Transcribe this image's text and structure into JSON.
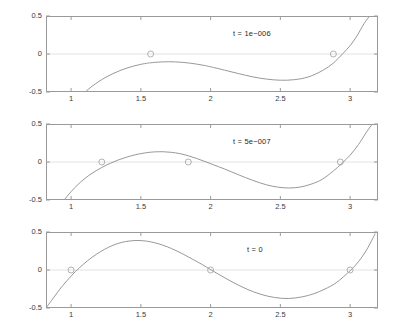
{
  "figure": {
    "background": "#ffffff",
    "axis_color": "#9a9a9a",
    "curve_color": "#8c8c8c",
    "marker_color": "#a8a8a8",
    "zeroline_color": "#e2e2e2",
    "text_color": "#3a3a3a"
  },
  "chart_data": [
    {
      "type": "line",
      "title": "t = 1e−006",
      "xlabel": "",
      "ylabel": "",
      "xlim": [
        0.82,
        3.2
      ],
      "ylim": [
        -0.5,
        0.5
      ],
      "xticks": [
        1,
        1.5,
        2,
        2.5,
        3
      ],
      "xticklabels": [
        "1",
        "1.5",
        "2",
        "2.5",
        "3"
      ],
      "yticks": [
        -0.5,
        0,
        0.5
      ],
      "yticklabels": [
        "-0.5",
        "0",
        "0.5"
      ],
      "grid": false,
      "legend": "none",
      "series": [
        {
          "name": "curve",
          "x": [
            1.1,
            1.15,
            1.2,
            1.25,
            1.3,
            1.35,
            1.4,
            1.45,
            1.5,
            1.55,
            1.57,
            1.6,
            1.65,
            1.7,
            1.75,
            1.8,
            1.85,
            1.9,
            1.95,
            2.0,
            2.1,
            2.2,
            2.3,
            2.4,
            2.5,
            2.6,
            2.7,
            2.8,
            2.88,
            2.95,
            3.0,
            3.05,
            3.1,
            3.14
          ],
          "y": [
            -0.5,
            -0.425,
            -0.36,
            -0.305,
            -0.258,
            -0.218,
            -0.185,
            -0.158,
            -0.136,
            -0.12,
            -0.116,
            -0.11,
            -0.104,
            -0.102,
            -0.104,
            -0.11,
            -0.12,
            -0.133,
            -0.149,
            -0.168,
            -0.212,
            -0.258,
            -0.3,
            -0.33,
            -0.345,
            -0.338,
            -0.302,
            -0.22,
            -0.12,
            0.01,
            0.11,
            0.24,
            0.4,
            0.5
          ]
        }
      ],
      "markers": [
        {
          "x": 1.57,
          "y": 0.0
        },
        {
          "x": 2.88,
          "y": 0.0
        }
      ]
    },
    {
      "type": "line",
      "title": "t = 5e−007",
      "xlabel": "",
      "ylabel": "",
      "xlim": [
        0.82,
        3.2
      ],
      "ylim": [
        -0.5,
        0.5
      ],
      "xticks": [
        1,
        1.5,
        2,
        2.5,
        3
      ],
      "xticklabels": [
        "1",
        "1.5",
        "2",
        "2.5",
        "3"
      ],
      "yticks": [
        -0.5,
        0,
        0.5
      ],
      "yticklabels": [
        "-0.5",
        "0",
        "0.5"
      ],
      "grid": false,
      "legend": "none",
      "series": [
        {
          "name": "curve",
          "x": [
            0.95,
            1.0,
            1.05,
            1.1,
            1.15,
            1.22,
            1.28,
            1.34,
            1.4,
            1.46,
            1.5,
            1.55,
            1.6,
            1.66,
            1.72,
            1.78,
            1.84,
            1.9,
            1.96,
            2.02,
            2.1,
            2.2,
            2.3,
            2.4,
            2.48,
            2.56,
            2.64,
            2.72,
            2.8,
            2.88,
            2.94,
            3.0,
            3.06,
            3.12,
            3.16
          ],
          "y": [
            -0.5,
            -0.39,
            -0.295,
            -0.215,
            -0.148,
            -0.072,
            -0.018,
            0.028,
            0.065,
            0.095,
            0.11,
            0.125,
            0.133,
            0.135,
            0.127,
            0.11,
            0.082,
            0.046,
            0.006,
            -0.036,
            -0.092,
            -0.168,
            -0.24,
            -0.3,
            -0.33,
            -0.342,
            -0.33,
            -0.292,
            -0.228,
            -0.118,
            -0.02,
            0.09,
            0.23,
            0.4,
            0.5
          ]
        }
      ],
      "markers": [
        {
          "x": 1.22,
          "y": 0.0
        },
        {
          "x": 1.84,
          "y": 0.0
        },
        {
          "x": 2.93,
          "y": 0.0
        }
      ]
    },
    {
      "type": "line",
      "title": "t = 0",
      "xlabel": "",
      "ylabel": "",
      "xlim": [
        0.82,
        3.2
      ],
      "ylim": [
        -0.5,
        0.5
      ],
      "xticks": [
        1,
        1.5,
        2,
        2.5,
        3
      ],
      "xticklabels": [
        "1",
        "1.5",
        "2",
        "2.5",
        "3"
      ],
      "yticks": [
        -0.5,
        0,
        0.5
      ],
      "yticklabels": [
        "-0.5",
        "0",
        "0.5"
      ],
      "grid": false,
      "legend": "none",
      "series": [
        {
          "name": "curve",
          "x": [
            0.82,
            0.86,
            0.9,
            0.94,
            1.0,
            1.06,
            1.12,
            1.18,
            1.24,
            1.3,
            1.36,
            1.42,
            1.48,
            1.54,
            1.6,
            1.66,
            1.72,
            1.8,
            1.88,
            1.94,
            2.0,
            2.08,
            2.16,
            2.26,
            2.36,
            2.46,
            2.56,
            2.66,
            2.74,
            2.82,
            2.9,
            3.0,
            3.06,
            3.12,
            3.18
          ],
          "y": [
            -0.5,
            -0.4,
            -0.3,
            -0.205,
            -0.08,
            0.03,
            0.125,
            0.205,
            0.272,
            0.325,
            0.362,
            0.382,
            0.388,
            0.38,
            0.358,
            0.325,
            0.282,
            0.212,
            0.132,
            0.072,
            0.005,
            -0.08,
            -0.162,
            -0.252,
            -0.32,
            -0.362,
            -0.375,
            -0.352,
            -0.312,
            -0.25,
            -0.168,
            -0.01,
            0.11,
            0.27,
            0.48
          ]
        }
      ],
      "markers": [
        {
          "x": 1.0,
          "y": 0.0
        },
        {
          "x": 2.0,
          "y": 0.0
        },
        {
          "x": 3.0,
          "y": 0.0
        }
      ]
    }
  ]
}
